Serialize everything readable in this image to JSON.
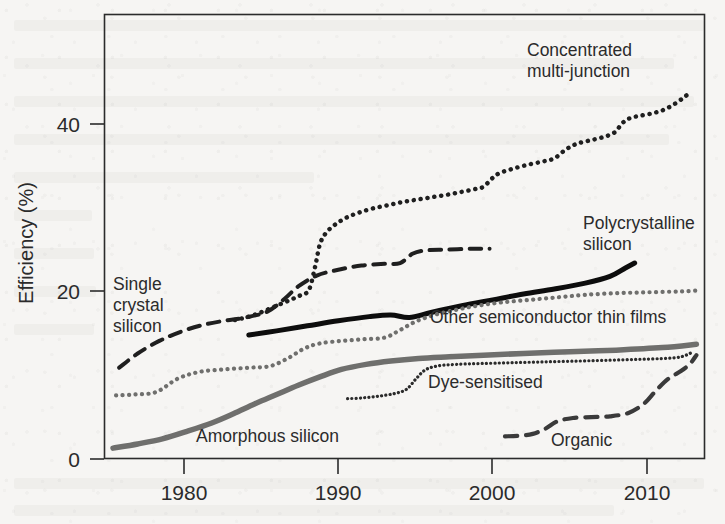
{
  "figure": {
    "background_color": "#f6f5f3",
    "frame_color": "#2b2b2b"
  },
  "axes": {
    "y_title": "Efficiency (%)",
    "y_ticks": [
      "0",
      "20",
      "40"
    ],
    "x_ticks": [
      "1980",
      "1990",
      "2000",
      "2010"
    ]
  },
  "labels": {
    "concentrated_line1": "Concentrated",
    "concentrated_line2": "multi-junction",
    "polycrystalline_line1": "Polycrystalline",
    "polycrystalline_line2": "silicon",
    "single_line1": "Single",
    "single_line2": "crystal",
    "single_line3": "silicon",
    "other_thin_films": "Other semiconductor thin films",
    "dye_sensitised": "Dye-sensitised",
    "amorphous": "Amorphous silicon",
    "organic": "Organic"
  },
  "chart_data": {
    "type": "line",
    "title": "",
    "xlabel": "",
    "ylabel": "Efficiency (%)",
    "xlim": [
      1975,
      2014
    ],
    "ylim": [
      0,
      47
    ],
    "grid": false,
    "legend": "inline-annotations",
    "x_ticks": [
      1980,
      1990,
      2000,
      2010
    ],
    "y_ticks": [
      0,
      20,
      40
    ],
    "series": [
      {
        "name": "Concentrated multi-junction",
        "style": "dotted",
        "color": "#1f1f1f",
        "linewidth": 4.5,
        "label_position": "upper-right",
        "points": [
          [
            1983.3,
            16.6
          ],
          [
            1984.2,
            17.0
          ],
          [
            1985.1,
            17.6
          ],
          [
            1986.0,
            18.3
          ],
          [
            1986.9,
            19.0
          ],
          [
            1987.6,
            19.6
          ],
          [
            1988.1,
            20.2
          ],
          [
            1988.5,
            23.0
          ],
          [
            1988.8,
            25.6
          ],
          [
            1989.2,
            27.0
          ],
          [
            1989.8,
            28.0
          ],
          [
            1990.5,
            28.8
          ],
          [
            1991.3,
            29.4
          ],
          [
            1992.2,
            29.9
          ],
          [
            1993.2,
            30.3
          ],
          [
            1994.2,
            30.7
          ],
          [
            1995.2,
            31.0
          ],
          [
            1996.2,
            31.3
          ],
          [
            1997.2,
            31.6
          ],
          [
            1998.0,
            31.9
          ],
          [
            1998.8,
            32.2
          ],
          [
            1999.4,
            32.5
          ],
          [
            1999.9,
            33.4
          ],
          [
            2000.4,
            34.1
          ],
          [
            2001.2,
            34.6
          ],
          [
            2002.2,
            35.1
          ],
          [
            2003.2,
            35.5
          ],
          [
            2004.0,
            35.9
          ],
          [
            2004.7,
            36.9
          ],
          [
            2005.4,
            37.6
          ],
          [
            2006.2,
            38.0
          ],
          [
            2007.1,
            38.4
          ],
          [
            2007.9,
            39.0
          ],
          [
            2008.4,
            40.1
          ],
          [
            2008.9,
            40.7
          ],
          [
            2009.6,
            41.0
          ],
          [
            2010.4,
            41.3
          ],
          [
            2011.1,
            41.7
          ],
          [
            2011.8,
            42.4
          ],
          [
            2012.4,
            43.2
          ],
          [
            2012.9,
            43.9
          ]
        ]
      },
      {
        "name": "Single crystal silicon",
        "style": "dashed",
        "color": "#1f1f1f",
        "linewidth": 4.0,
        "label_position": "left",
        "points": [
          [
            1975.8,
            10.9
          ],
          [
            1977.0,
            12.6
          ],
          [
            1978.4,
            14.1
          ],
          [
            1979.8,
            15.2
          ],
          [
            1981.2,
            16.0
          ],
          [
            1982.6,
            16.5
          ],
          [
            1984.0,
            16.9
          ],
          [
            1985.4,
            17.6
          ],
          [
            1986.5,
            19.1
          ],
          [
            1987.4,
            20.6
          ],
          [
            1988.6,
            21.9
          ],
          [
            1990.0,
            22.6
          ],
          [
            1991.5,
            23.1
          ],
          [
            1993.0,
            23.3
          ],
          [
            1994.0,
            23.4
          ],
          [
            1994.8,
            24.5
          ],
          [
            1995.6,
            24.9
          ],
          [
            1997.0,
            25.0
          ],
          [
            1998.6,
            25.1
          ],
          [
            1999.8,
            25.1
          ]
        ]
      },
      {
        "name": "Polycrystalline silicon",
        "style": "solid",
        "color": "#0d0d0d",
        "linewidth": 5.0,
        "label_position": "right",
        "points": [
          [
            1984.2,
            14.8
          ],
          [
            1986.0,
            15.3
          ],
          [
            1988.0,
            15.9
          ],
          [
            1990.0,
            16.5
          ],
          [
            1992.0,
            17.0
          ],
          [
            1993.4,
            17.2
          ],
          [
            1994.6,
            16.9
          ],
          [
            1996.0,
            17.5
          ],
          [
            1998.0,
            18.3
          ],
          [
            2000.0,
            19.0
          ],
          [
            2002.0,
            19.7
          ],
          [
            2004.0,
            20.3
          ],
          [
            2006.0,
            21.0
          ],
          [
            2007.6,
            21.8
          ],
          [
            2008.6,
            22.8
          ],
          [
            2009.2,
            23.4
          ]
        ]
      },
      {
        "name": "Other semiconductor thin films",
        "style": "dotted",
        "color": "#6f6f6d",
        "linewidth": 4.2,
        "label_position": "right-mid",
        "points": [
          [
            1975.6,
            7.6
          ],
          [
            1976.8,
            7.7
          ],
          [
            1978.2,
            8.0
          ],
          [
            1979.6,
            9.6
          ],
          [
            1981.0,
            10.4
          ],
          [
            1982.6,
            10.7
          ],
          [
            1984.2,
            10.9
          ],
          [
            1985.6,
            11.1
          ],
          [
            1986.8,
            12.1
          ],
          [
            1987.8,
            13.2
          ],
          [
            1988.8,
            13.8
          ],
          [
            1990.2,
            14.1
          ],
          [
            1991.6,
            14.3
          ],
          [
            1993.0,
            14.5
          ],
          [
            1994.0,
            15.4
          ],
          [
            1995.0,
            16.4
          ],
          [
            1996.2,
            17.2
          ],
          [
            1997.6,
            17.8
          ],
          [
            1999.0,
            18.3
          ],
          [
            2000.6,
            18.7
          ],
          [
            2002.4,
            19.0
          ],
          [
            2004.2,
            19.3
          ],
          [
            2006.0,
            19.6
          ],
          [
            2008.0,
            19.8
          ],
          [
            2010.0,
            19.9
          ],
          [
            2012.0,
            20.0
          ],
          [
            2013.2,
            20.1
          ]
        ]
      },
      {
        "name": "Amorphous silicon",
        "style": "solid",
        "color": "#6f6f6d",
        "linewidth": 5.5,
        "label_position": "bottom-left",
        "points": [
          [
            1975.4,
            1.3
          ],
          [
            1977.0,
            1.8
          ],
          [
            1978.6,
            2.4
          ],
          [
            1980.2,
            3.3
          ],
          [
            1981.8,
            4.3
          ],
          [
            1983.2,
            5.4
          ],
          [
            1984.6,
            6.6
          ],
          [
            1986.0,
            7.7
          ],
          [
            1987.4,
            8.8
          ],
          [
            1988.8,
            9.8
          ],
          [
            1990.2,
            10.7
          ],
          [
            1991.8,
            11.3
          ],
          [
            1993.4,
            11.7
          ],
          [
            1995.2,
            12.0
          ],
          [
            1997.2,
            12.2
          ],
          [
            1999.4,
            12.4
          ],
          [
            2002.0,
            12.6
          ],
          [
            2005.0,
            12.8
          ],
          [
            2008.0,
            13.0
          ],
          [
            2011.0,
            13.3
          ],
          [
            2013.2,
            13.7
          ]
        ]
      },
      {
        "name": "Dye-sensitised",
        "style": "fine-dotted",
        "color": "#2b2b2b",
        "linewidth": 3.2,
        "label_position": "mid",
        "points": [
          [
            1990.6,
            7.2
          ],
          [
            1991.6,
            7.3
          ],
          [
            1992.6,
            7.5
          ],
          [
            1993.6,
            7.8
          ],
          [
            1994.4,
            8.3
          ],
          [
            1995.0,
            9.5
          ],
          [
            1995.6,
            10.6
          ],
          [
            1996.4,
            11.1
          ],
          [
            1997.6,
            11.3
          ],
          [
            1999.2,
            11.4
          ],
          [
            2001.2,
            11.5
          ],
          [
            2003.4,
            11.6
          ],
          [
            2005.6,
            11.7
          ],
          [
            2007.6,
            11.8
          ],
          [
            2009.4,
            11.9
          ],
          [
            2011.0,
            12.0
          ],
          [
            2012.2,
            12.2
          ],
          [
            2013.0,
            12.8
          ]
        ]
      },
      {
        "name": "Organic",
        "style": "dashed",
        "color": "#3a3a3a",
        "linewidth": 4.2,
        "label_position": "bottom-right",
        "points": [
          [
            2000.8,
            2.7
          ],
          [
            2001.8,
            2.8
          ],
          [
            2002.6,
            3.0
          ],
          [
            2003.4,
            3.6
          ],
          [
            2004.2,
            4.5
          ],
          [
            2005.2,
            4.9
          ],
          [
            2006.4,
            5.0
          ],
          [
            2007.6,
            5.1
          ],
          [
            2008.8,
            5.5
          ],
          [
            2009.8,
            6.6
          ],
          [
            2010.6,
            8.2
          ],
          [
            2011.4,
            9.6
          ],
          [
            2012.2,
            10.5
          ],
          [
            2012.8,
            11.4
          ],
          [
            2013.2,
            12.4
          ]
        ]
      }
    ]
  }
}
